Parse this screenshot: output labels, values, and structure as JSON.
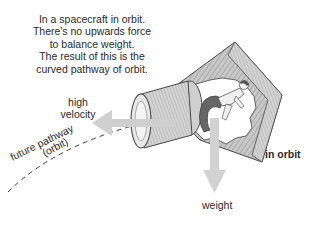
{
  "caption": {
    "lines": [
      "In a spacecraft in orbit.",
      "There's no upwards force",
      "to balance weight.",
      "The result of this is the",
      "curved pathway of orbit."
    ]
  },
  "labels": {
    "velocity_line1": "high",
    "velocity_line2": "velocity",
    "weight": "weight",
    "in_orbit": "in orbit",
    "pathway": "future pathway",
    "orbit": "(orbit)"
  },
  "colors": {
    "arrow": "#cfcfcf",
    "hull_fill": "#bdbdbd",
    "hull_stroke": "#555555",
    "text": "#2a2a2a"
  },
  "icons": {
    "spacecraft": "spacecraft-illustration",
    "astronaut": "floating-astronaut",
    "velocity_arrow": "arrow-left",
    "weight_arrow": "arrow-down"
  }
}
